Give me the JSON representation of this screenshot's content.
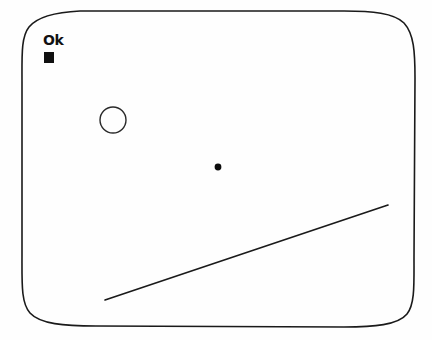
{
  "canvas": {
    "title": "Ok",
    "background_color": "#fefefe",
    "ink_color": "#1a1a1a",
    "width": 432,
    "height": 340
  },
  "frame": {
    "name": "hand-drawn rounded rectangle border",
    "stroke_color": "#1a1a1a",
    "stroke_width": 1.6,
    "bounds": {
      "left": 22,
      "top": 10,
      "right": 415,
      "bottom": 327
    },
    "corner_radius": 58
  },
  "label": {
    "text": "Ok",
    "color": "#111111",
    "x": 43,
    "y": 33
  },
  "caret": {
    "name": "filled square cursor block",
    "color": "#101010",
    "x": 44,
    "y": 52,
    "width": 10,
    "height": 11
  },
  "shapes": [
    {
      "id": "circle-outline",
      "type": "circle",
      "filled": false,
      "stroke_color": "#2a2a2a",
      "stroke_width": 1.4,
      "cx": 113,
      "cy": 120,
      "r": 13
    },
    {
      "id": "dot-point",
      "type": "dot",
      "filled": true,
      "fill_color": "#0d0d0d",
      "cx": 218,
      "cy": 167,
      "r": 3.4
    },
    {
      "id": "diagonal-line",
      "type": "line",
      "stroke_color": "#1a1a1a",
      "stroke_width": 1.7,
      "x1": 105,
      "y1": 300,
      "x2": 388,
      "y2": 205
    }
  ]
}
